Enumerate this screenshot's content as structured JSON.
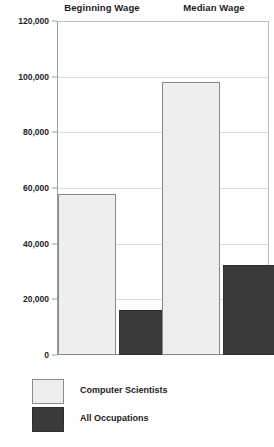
{
  "chart_data": {
    "type": "bar",
    "title": "",
    "xlabel": "",
    "ylabel": "",
    "categories": [
      "Beginning Wage",
      "Median Wage"
    ],
    "series": [
      {
        "name": "Computer Scientists",
        "color": "#eeeeee",
        "values": [
          58000,
          98000
        ]
      },
      {
        "name": "All Occupations",
        "color": "#3a3a3a",
        "values": [
          16000,
          32500
        ]
      }
    ],
    "ylim": [
      0,
      120000
    ],
    "ytick_values": [
      120000,
      100000,
      80000,
      60000,
      40000,
      20000,
      0
    ],
    "ytick_labels": [
      "120,000",
      "100,000",
      "80,000",
      "60,000",
      "40,000",
      "20,000",
      "0"
    ],
    "grid": true,
    "legend_position": "bottom-left"
  },
  "legend": {
    "items": [
      {
        "label": "Computer Scientists",
        "swatch": "light"
      },
      {
        "label": "All Occupations",
        "swatch": "dark"
      }
    ]
  }
}
